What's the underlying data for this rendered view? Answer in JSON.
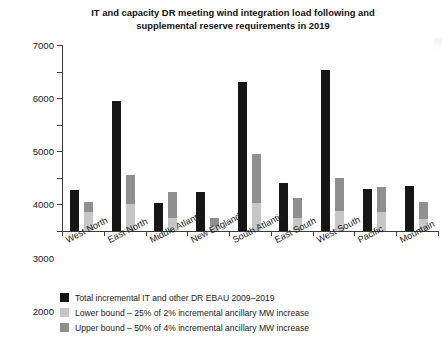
{
  "chart_data": {
    "type": "bar",
    "title": "IT and capacity DR meeting wind integration load following and supplemental reserve requirements in 2019",
    "title_line1": "IT and capacity DR meeting wind integration load following and",
    "title_line2": "supplemental reserve requirements in 2019",
    "xlabel": "",
    "ylabel": "",
    "ylim": [
      0,
      7000
    ],
    "ytick_values": [
      0,
      1000,
      2000,
      3000,
      4000,
      5000,
      6000,
      7000
    ],
    "ytick_labels": [
      "0",
      "1000",
      "2000",
      "3000",
      "4000",
      "5000",
      "6000",
      "7000"
    ],
    "grid": false,
    "legend_position": "below",
    "stacked_secondary_bar": true,
    "categories": [
      "West North",
      "East North",
      "Middle Atlantic",
      "New England",
      "South Atlantic",
      "East South",
      "West South",
      "Pacific",
      "Mountain"
    ],
    "series": [
      {
        "name": "Total incremental IT and other DR EBAU 2009–2019",
        "color": "#161616",
        "values": [
          1550,
          4900,
          1050,
          1450,
          5600,
          1800,
          6050,
          1600,
          1700
        ]
      },
      {
        "name": "Lower bound – 25% of  2% incremental ancillary MW increase",
        "color": "#c6c6c6",
        "values": [
          700,
          1000,
          500,
          200,
          1050,
          500,
          750,
          700,
          450
        ]
      },
      {
        "name": "Upper bound – 50% of  4% incremental ancillary MW increase",
        "color": "#8f8f8f",
        "values": [
          1100,
          2100,
          1450,
          500,
          2900,
          1250,
          2000,
          1650,
          1100
        ]
      }
    ]
  },
  "legend": {
    "items": [
      {
        "label": "Total incremental IT and other DR EBAU 2009–2019",
        "color": "#161616"
      },
      {
        "label": "Lower bound – 25% of  2% incremental ancillary MW increase",
        "color": "#c6c6c6"
      },
      {
        "label": "Upper bound – 50% of  4% incremental ancillary MW increase",
        "color": "#8f8f8f"
      }
    ]
  }
}
